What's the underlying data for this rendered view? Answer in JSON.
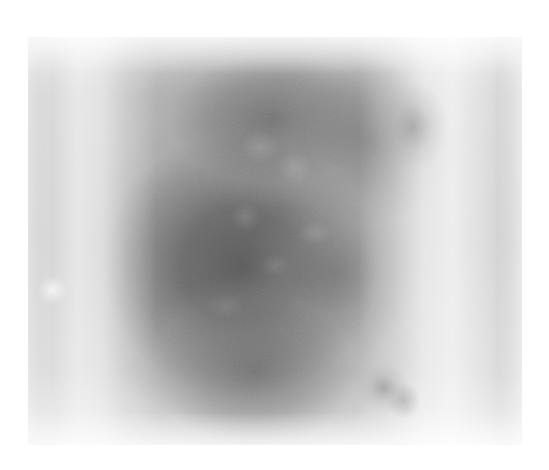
{
  "page": {
    "width": 549,
    "height": 470,
    "background_color": "#ffffff",
    "content_type": "grayscale-scan-image",
    "alt_text": ""
  },
  "image": {
    "name": "grayscale-diffuse-mass-scan",
    "left": 28,
    "top": 37,
    "width": 494,
    "height": 408,
    "colors": {
      "background": "#ffffff",
      "plate_base": "#c9c9c9",
      "lightest": "#e2e2e2",
      "mid": "#b4b4b4",
      "mass_core": "#6e6e6e",
      "darkest": "#646464"
    },
    "regions": [
      {
        "name": "top-edge-band",
        "tone": "light",
        "hex": "#cfcfcf"
      },
      {
        "name": "left-bright-halo",
        "tone": "bright",
        "hex": "#dedede"
      },
      {
        "name": "right-bright-halo",
        "tone": "bright",
        "hex": "#e0e0e0"
      },
      {
        "name": "central-dark-mass",
        "tone": "dark",
        "hex": "#6e6e6e"
      },
      {
        "name": "upper-dark-band",
        "tone": "dark",
        "hex": "#6a6a6a"
      },
      {
        "name": "lower-dark-lobe",
        "tone": "dark",
        "hex": "#747474"
      },
      {
        "name": "bottom-edge-band",
        "tone": "light",
        "hex": "#d6d6d6"
      },
      {
        "name": "lower-right-smudge",
        "tone": "dark-speckle",
        "hex": "#8a8a8a"
      },
      {
        "name": "upper-right-streak",
        "tone": "dark-speckle",
        "hex": "#8f8f8f"
      },
      {
        "name": "mid-left-bright-fleck",
        "tone": "bright",
        "hex": "#f0f0f0"
      }
    ],
    "texture": "fine film grain"
  }
}
